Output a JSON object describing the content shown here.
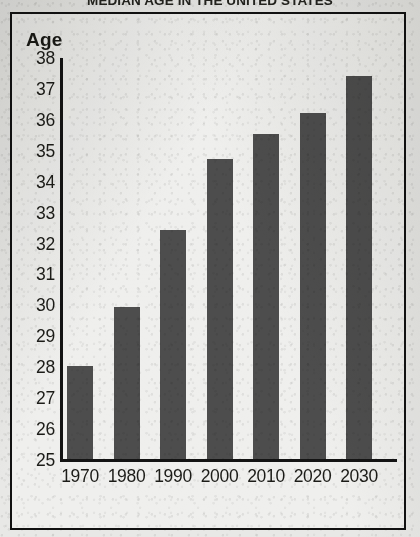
{
  "title": "MEDIAN AGE IN THE UNITED STATES",
  "axis": {
    "y_title": "Age",
    "y_ticks": [
      "38",
      "37",
      "36",
      "35",
      "34",
      "33",
      "32",
      "31",
      "30",
      "29",
      "28",
      "27",
      "26",
      "25"
    ],
    "x_ticks": [
      "1970",
      "1980",
      "1990",
      "2000",
      "2010",
      "2020",
      "2030"
    ]
  },
  "colors": {
    "bar": "#4d4d4d",
    "axis": "#141414",
    "frame": "#111111",
    "paper": "#efefed",
    "text": "#1c1c18"
  },
  "chart_data": {
    "type": "bar",
    "title": "MEDIAN AGE IN THE UNITED STATES",
    "xlabel": "",
    "ylabel": "Age",
    "ylim": [
      25,
      38
    ],
    "grid": false,
    "legend": false,
    "categories": [
      "1970",
      "1980",
      "1990",
      "2000",
      "2010",
      "2020",
      "2030"
    ],
    "values": [
      28.0,
      29.9,
      32.4,
      34.7,
      35.5,
      36.2,
      37.4
    ],
    "series": [
      {
        "name": "Median age",
        "values": [
          28.0,
          29.9,
          32.4,
          34.7,
          35.5,
          36.2,
          37.4
        ]
      }
    ],
    "y_tick_values": [
      25,
      26,
      27,
      28,
      29,
      30,
      31,
      32,
      33,
      34,
      35,
      36,
      37,
      38
    ],
    "bar_color": "#4d4d4d"
  }
}
